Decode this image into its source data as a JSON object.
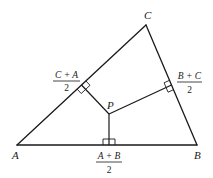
{
  "diagram": {
    "type": "geometry",
    "description_visible": "Triangle ABC with perpendicular bisectors from side midpoints meeting at P",
    "vertices": {
      "A": {
        "label": "A",
        "x": 17,
        "y": 145
      },
      "B": {
        "label": "B",
        "x": 197,
        "y": 145
      },
      "C": {
        "label": "C",
        "x": 146,
        "y": 25
      }
    },
    "point_P": {
      "label": "P",
      "x": 109,
      "y": 114
    },
    "midpoints": [
      {
        "id": "AB",
        "numerator": "A + B",
        "denominator": "2",
        "x": 109,
        "y": 145
      },
      {
        "id": "BC",
        "numerator": "B + C",
        "denominator": "2",
        "x": 171.5,
        "y": 85
      },
      {
        "id": "CA",
        "numerator": "C + A",
        "denominator": "2",
        "x": 81.5,
        "y": 85
      }
    ],
    "colors": {
      "stroke": "#1a1a1a",
      "background": "#ffffff"
    }
  }
}
